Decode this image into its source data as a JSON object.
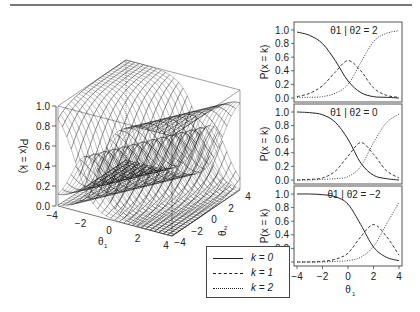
{
  "figure": {
    "legend": {
      "items": [
        {
          "label": "k = 0",
          "style": "solid"
        },
        {
          "label": "k = 1",
          "style": "dashed"
        },
        {
          "label": "k = 2",
          "style": "dotted"
        }
      ]
    }
  },
  "chart_data": [
    {
      "type": "surface",
      "title": "",
      "xlabel": "θ1",
      "ylabel": "θ2",
      "zlabel": "P(x = k)",
      "x_ticks": [
        "-4",
        "-2",
        "0",
        "2",
        "4"
      ],
      "y_ticks": [
        "-4",
        "-2",
        "0",
        "2",
        "4"
      ],
      "z_ticks": [
        "0.0",
        "0.2",
        "0.4",
        "0.6",
        "0.8",
        "1.0"
      ],
      "xlim": [
        -4,
        4
      ],
      "ylim": [
        -4,
        4
      ],
      "zlim": [
        0,
        1
      ],
      "series": [
        {
          "name": "k = 0",
          "description": "decreasing logistic ridge surface"
        },
        {
          "name": "k = 1",
          "description": "peak surface ~0.55 at the crossing"
        },
        {
          "name": "k = 2",
          "description": "increasing logistic ridge surface"
        }
      ]
    },
    {
      "type": "line",
      "title": "θ1 | θ2 = 2",
      "xlabel": "θ1",
      "ylabel": "P(x = k)",
      "xlim": [
        -4,
        4
      ],
      "ylim": [
        0,
        1
      ],
      "y_ticks": [
        "0.0",
        "0.2",
        "0.4",
        "0.6",
        "0.8",
        "1.0"
      ],
      "x": [
        -4,
        -3,
        -2,
        -1,
        0,
        1,
        2,
        3,
        4
      ],
      "series": [
        {
          "name": "k = 0",
          "style": "solid",
          "values": [
            0.97,
            0.92,
            0.8,
            0.55,
            0.25,
            0.08,
            0.02,
            0.01,
            0.0
          ]
        },
        {
          "name": "k = 1",
          "style": "dashed",
          "values": [
            0.02,
            0.07,
            0.18,
            0.38,
            0.55,
            0.4,
            0.15,
            0.04,
            0.01
          ]
        },
        {
          "name": "k = 2",
          "style": "dotted",
          "values": [
            0.01,
            0.01,
            0.02,
            0.07,
            0.2,
            0.52,
            0.83,
            0.95,
            0.99
          ]
        }
      ]
    },
    {
      "type": "line",
      "title": "θ1 | θ2 = 0",
      "xlabel": "θ1",
      "ylabel": "P(x = k)",
      "xlim": [
        -4,
        4
      ],
      "ylim": [
        0,
        1
      ],
      "y_ticks": [
        "0.0",
        "0.2",
        "0.4",
        "0.6",
        "0.8",
        "1.0"
      ],
      "x": [
        -4,
        -3,
        -2,
        -1,
        0,
        1,
        2,
        3,
        4
      ],
      "series": [
        {
          "name": "k = 0",
          "style": "solid",
          "values": [
            1.0,
            0.99,
            0.96,
            0.85,
            0.6,
            0.25,
            0.07,
            0.02,
            0.0
          ]
        },
        {
          "name": "k = 1",
          "style": "dashed",
          "values": [
            0.0,
            0.01,
            0.03,
            0.13,
            0.35,
            0.55,
            0.38,
            0.14,
            0.03
          ]
        },
        {
          "name": "k = 2",
          "style": "dotted",
          "values": [
            0.0,
            0.0,
            0.01,
            0.02,
            0.05,
            0.2,
            0.55,
            0.84,
            0.97
          ]
        }
      ]
    },
    {
      "type": "line",
      "title": "θ1 | θ2 = −2",
      "xlabel": "θ1",
      "ylabel": "P(x = k)",
      "xlim": [
        -4,
        4
      ],
      "ylim": [
        0,
        1
      ],
      "x_ticks": [
        "-4",
        "-2",
        "0",
        "2",
        "4"
      ],
      "y_ticks": [
        "0.0",
        "0.2",
        "0.4",
        "0.6",
        "0.8",
        "1.0"
      ],
      "x": [
        -4,
        -3,
        -2,
        -1,
        0,
        1,
        2,
        3,
        4
      ],
      "series": [
        {
          "name": "k = 0",
          "style": "solid",
          "values": [
            1.0,
            1.0,
            0.99,
            0.96,
            0.85,
            0.55,
            0.22,
            0.07,
            0.02
          ]
        },
        {
          "name": "k = 1",
          "style": "dashed",
          "values": [
            0.0,
            0.0,
            0.01,
            0.04,
            0.13,
            0.37,
            0.55,
            0.38,
            0.1
          ]
        },
        {
          "name": "k = 2",
          "style": "dotted",
          "values": [
            0.0,
            0.0,
            0.0,
            0.01,
            0.02,
            0.07,
            0.23,
            0.55,
            0.88
          ]
        }
      ]
    }
  ]
}
